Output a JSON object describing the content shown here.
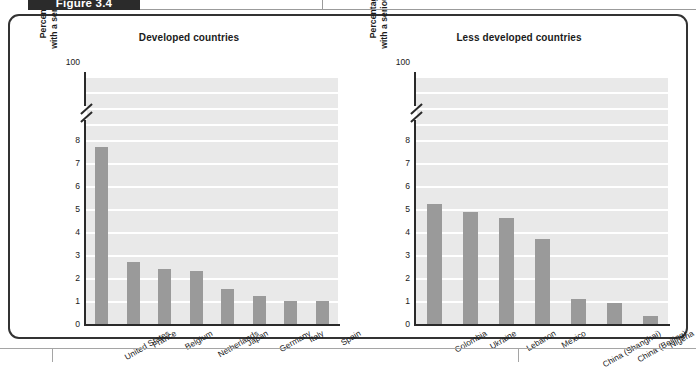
{
  "figure": {
    "tab_label": "Figure 3.4"
  },
  "chart_data": [
    {
      "type": "bar",
      "title": "Developed countries",
      "ylabel_line1": "Percentage of population",
      "ylabel_line2": "with a serious mental disorder",
      "xlabel": "",
      "categories": [
        "United States",
        "France",
        "Belgium",
        "Netherlands",
        "Japan",
        "Germany",
        "Italy",
        "Spain"
      ],
      "values": [
        7.7,
        2.7,
        2.4,
        2.3,
        1.5,
        1.2,
        1.0,
        1.0
      ],
      "yticks": [
        "0",
        "1",
        "2",
        "3",
        "4",
        "5",
        "6",
        "7",
        "8",
        "100"
      ],
      "ylim": [
        0,
        8
      ],
      "axis_break": true,
      "grid": true,
      "legend": "none",
      "bar_color": "#9a9a9a",
      "plot_bg": "#e9e9e9"
    },
    {
      "type": "bar",
      "title": "Less developed countries",
      "ylabel_line1": "Percentage of population",
      "ylabel_line2": "with a serious mental disorder",
      "xlabel": "",
      "categories": [
        "Colombia",
        "Ukraine",
        "Lebanon",
        "Mexico",
        "China (Shanghai)",
        "China (Beijing)",
        "Nigeria"
      ],
      "values": [
        5.2,
        4.85,
        4.6,
        3.7,
        1.1,
        0.9,
        0.35
      ],
      "yticks": [
        "0",
        "1",
        "2",
        "3",
        "4",
        "5",
        "6",
        "7",
        "8",
        "100"
      ],
      "ylim": [
        0,
        8
      ],
      "axis_break": true,
      "grid": true,
      "legend": "none",
      "bar_color": "#9a9a9a",
      "plot_bg": "#e9e9e9"
    }
  ]
}
